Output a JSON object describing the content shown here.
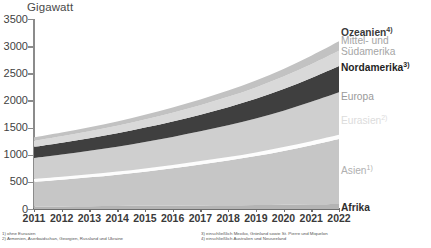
{
  "chart": {
    "axis_title": "Gigawatt",
    "y_ticks": [
      "3500",
      "3000",
      "2500",
      "2000",
      "1500",
      "1000",
      "500",
      "0"
    ],
    "x_ticks": [
      "2011",
      "2012",
      "2013",
      "2014",
      "2015",
      "2016",
      "2017",
      "2018",
      "2019",
      "2020",
      "2021",
      "2022"
    ]
  },
  "legend": {
    "ozeanien": "Ozeanien",
    "ozeanien_sup": "4)",
    "mittel_suedamerika_line1": "Mittel- und",
    "mittel_suedamerika_line2": "Südamerika",
    "nordamerika": "Nordamerika",
    "nordamerika_sup": "3)",
    "europa": "Europa",
    "eurasien": "Eurasien",
    "eurasien_sup": "2)",
    "asien": "Asien",
    "asien_sup": "1)",
    "afrika": "Afrika"
  },
  "footnotes": {
    "left": [
      "1) ohne Eurasien",
      "2) Armenien, Aserbaidschan, Georgien, Russland und Ukraine"
    ],
    "right": [
      "3) einschließlich Mexiko, Grönland sowie St. Pierre und Miquelon",
      "4) einschließlich Australien und Neuseeland"
    ]
  },
  "colors": {
    "afrika": "#b4b4b4",
    "asien": "#c6c6c6",
    "eurasien": "#fdfdfd",
    "europa": "#cfcfcf",
    "nordamerika": "#3f3f3f",
    "mittel_suedamerika": "#d9d9d9",
    "ozeanien": "#c2c2c2",
    "axis": "#8b8b8b",
    "legend_dark": "#3a3a3a",
    "legend_mid": "#9a9a9a",
    "legend_light": "#c9c9c9",
    "legend_white": "#e6e6e6"
  },
  "chart_data": {
    "type": "area",
    "title": "Gigawatt",
    "xlabel": "",
    "ylabel": "Gigawatt",
    "ylim": [
      0,
      3500
    ],
    "grid": false,
    "legend_position": "right",
    "stacked": true,
    "x": [
      2011,
      2012,
      2013,
      2014,
      2015,
      2016,
      2017,
      2018,
      2019,
      2020,
      2021,
      2022
    ],
    "series": [
      {
        "name": "Afrika",
        "values": [
          45,
          48,
          51,
          54,
          58,
          62,
          66,
          70,
          75,
          80,
          86,
          92
        ]
      },
      {
        "name": "Asien",
        "values": [
          455,
          492,
          532,
          578,
          630,
          688,
          752,
          822,
          900,
          990,
          1090,
          1198
        ]
      },
      {
        "name": "Eurasien",
        "values": [
          55,
          56,
          57,
          58,
          60,
          62,
          64,
          66,
          68,
          70,
          73,
          76
        ]
      },
      {
        "name": "Europa",
        "values": [
          385,
          408,
          432,
          458,
          486,
          516,
          548,
          584,
          625,
          672,
          725,
          784
        ]
      },
      {
        "name": "Nordamerika",
        "values": [
          205,
          218,
          232,
          248,
          266,
          286,
          308,
          334,
          364,
          398,
          438,
          482
        ]
      },
      {
        "name": "Mittel- und Südamerika",
        "values": [
          110,
          118,
          127,
          137,
          148,
          160,
          174,
          190,
          208,
          229,
          253,
          281
        ]
      },
      {
        "name": "Ozeanien",
        "values": [
          65,
          70,
          75,
          81,
          88,
          96,
          105,
          115,
          127,
          141,
          157,
          175
        ]
      }
    ],
    "cumulative_totals": [
      1320,
      1410,
      1506,
      1614,
      1736,
      1870,
      2017,
      2181,
      2367,
      2580,
      2822,
      3088
    ]
  }
}
